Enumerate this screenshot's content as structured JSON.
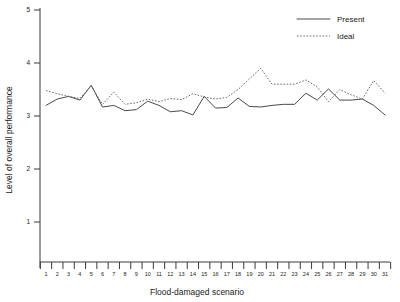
{
  "chart_data": {
    "type": "line",
    "title": "",
    "xlabel": "Flood-damaged scenario",
    "ylabel": "Level of overall performance",
    "categories": [
      1,
      2,
      3,
      4,
      5,
      6,
      7,
      8,
      9,
      10,
      11,
      12,
      13,
      14,
      15,
      16,
      17,
      18,
      19,
      20,
      21,
      22,
      23,
      24,
      25,
      26,
      27,
      28,
      29,
      30,
      31
    ],
    "xtick_labels": [
      "1",
      "2",
      "3",
      "4",
      "5",
      "6",
      "7",
      "8",
      "9",
      "10",
      "11",
      "12",
      "13",
      "14",
      "15",
      "16",
      "17",
      "18",
      "19",
      "20",
      "21",
      "22",
      "23",
      "24",
      "25",
      "26",
      "27",
      "28",
      "29",
      "30",
      "31"
    ],
    "ytick_labels": [
      "1",
      "2",
      "3",
      "4",
      "5"
    ],
    "yticks": [
      1,
      2,
      3,
      4,
      5
    ],
    "ylim": [
      0,
      5
    ],
    "xlim": [
      1,
      31
    ],
    "grid": false,
    "legend_position": "top-right",
    "series": [
      {
        "name": "Present",
        "style": "solid",
        "color": "#4a4a4a",
        "values": [
          3.2,
          3.32,
          3.37,
          3.3,
          3.58,
          3.17,
          3.2,
          3.1,
          3.12,
          3.28,
          3.2,
          3.08,
          3.1,
          3.02,
          3.37,
          3.15,
          3.16,
          3.34,
          3.18,
          3.17,
          3.2,
          3.22,
          3.22,
          3.43,
          3.3,
          3.51,
          3.3,
          3.3,
          3.32,
          3.2,
          3.02
        ]
      },
      {
        "name": "Ideal",
        "style": "dotted",
        "color": "#6a6a6a",
        "values": [
          3.48,
          3.42,
          3.37,
          3.33,
          3.57,
          3.22,
          3.45,
          3.22,
          3.25,
          3.32,
          3.27,
          3.33,
          3.31,
          3.42,
          3.36,
          3.32,
          3.35,
          3.5,
          3.7,
          3.9,
          3.6,
          3.6,
          3.6,
          3.68,
          3.55,
          3.27,
          3.5,
          3.4,
          3.32,
          3.67,
          3.43
        ]
      }
    ],
    "legend": [
      {
        "label": "Present",
        "style": "solid"
      },
      {
        "label": "Ideal",
        "style": "dotted"
      }
    ]
  }
}
